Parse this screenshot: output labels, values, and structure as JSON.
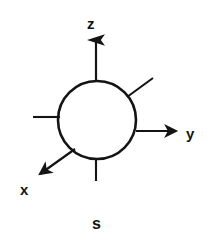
{
  "figure": {
    "name": "s-orbital-with-cartesian-axes",
    "background_color": "#ffffff",
    "stroke_color": "#141414",
    "canvas": {
      "width": 207,
      "height": 249
    }
  },
  "orbital": {
    "shape": "circle",
    "caption": "s",
    "center": {
      "x": 97,
      "y": 120
    },
    "radius": 39,
    "stroke_width": 2.6
  },
  "axes": [
    {
      "key": "z",
      "label": "z",
      "direction": "up",
      "arrowhead": true,
      "from": {
        "x": 96,
        "y": 81
      },
      "to": {
        "x": 96,
        "y": 37
      }
    },
    {
      "key": "y",
      "label": "y",
      "direction": "right",
      "arrowhead": true,
      "from": {
        "x": 136,
        "y": 131
      },
      "to": {
        "x": 181,
        "y": 131
      }
    },
    {
      "key": "x",
      "label": "x",
      "direction": "down-left",
      "arrowhead": true,
      "from": {
        "x": 74,
        "y": 149
      },
      "to": {
        "x": 36,
        "y": 177
      }
    }
  ],
  "stub_lines": [
    {
      "key": "upper-right-stub",
      "from": {
        "x": 127,
        "y": 97
      },
      "to": {
        "x": 153,
        "y": 78
      }
    },
    {
      "key": "left-stub",
      "from": {
        "x": 59,
        "y": 117
      },
      "to": {
        "x": 33,
        "y": 117
      }
    },
    {
      "key": "bottom-stub",
      "from": {
        "x": 96,
        "y": 158
      },
      "to": {
        "x": 96,
        "y": 181
      }
    }
  ],
  "labels": {
    "z": "z",
    "y": "y",
    "x": "x",
    "orbital": "s"
  }
}
